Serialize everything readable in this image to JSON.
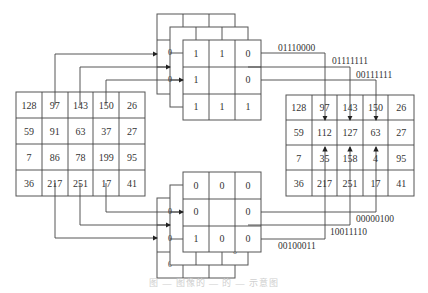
{
  "diagram": {
    "input_matrix": {
      "rows": [
        [
          "128",
          "97",
          "143",
          "150",
          "26"
        ],
        [
          "59",
          "91",
          "63",
          "37",
          "27"
        ],
        [
          "7",
          "86",
          "78",
          "199",
          "95"
        ],
        [
          "36",
          "217",
          "251",
          "17",
          "41"
        ]
      ]
    },
    "output_matrix": {
      "rows": [
        [
          "128",
          "97",
          "143",
          "150",
          "26"
        ],
        [
          "59",
          "112",
          "127",
          "63",
          "27"
        ],
        [
          "7",
          "35",
          "158",
          "4",
          "95"
        ],
        [
          "36",
          "217",
          "251",
          "17",
          "41"
        ]
      ]
    },
    "top_mask": {
      "rows": [
        [
          "1",
          "1",
          "0"
        ],
        [
          "1",
          "",
          "0"
        ],
        [
          "1",
          "1",
          "1"
        ]
      ],
      "side_labels": [
        "0",
        "0"
      ],
      "codes": [
        "01110000",
        "01111111",
        "00111111"
      ]
    },
    "bottom_mask": {
      "rows": [
        [
          "0",
          "0",
          "0"
        ],
        [
          "0",
          "",
          "0"
        ],
        [
          "1",
          "0",
          "0"
        ]
      ],
      "side_labels": [
        "0",
        "0"
      ],
      "codes": [
        "00000100",
        "10011110",
        "00100011"
      ]
    },
    "caption": "图 — 图像的 — 的 — 示意图"
  },
  "colors": {
    "line": "#444444",
    "text": "#333333",
    "background": "#ffffff"
  }
}
